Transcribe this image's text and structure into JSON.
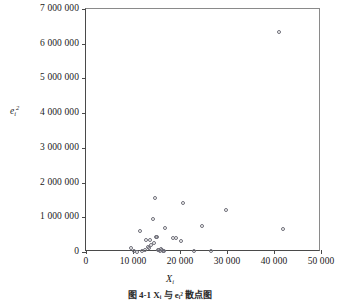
{
  "figure": {
    "caption": "图 4-1  Xᵢ 与 eᵢ² 散点图",
    "background_color": "#ffffff",
    "axis_color": "#4a4a4a",
    "marker_color": "#6e6e78"
  },
  "axis_titles": {
    "x": {
      "symbol": "X",
      "subscript": "i"
    },
    "y": {
      "symbol": "e",
      "subscript": "i",
      "superscript": "2"
    }
  },
  "chart_data": {
    "type": "scatter",
    "title": "",
    "subtitle": "",
    "xlabel": "X_i",
    "ylabel": "e_i^2",
    "xlim": [
      0,
      50000
    ],
    "ylim": [
      0,
      7000000
    ],
    "grid": false,
    "legend": "none",
    "marker": "open-circle",
    "xticks": [
      0,
      10000,
      20000,
      30000,
      40000,
      50000
    ],
    "xticklabels": [
      "0",
      "10 000",
      "20 000",
      "30 000",
      "40 000",
      "50 000"
    ],
    "yticks": [
      0,
      1000000,
      2000000,
      3000000,
      4000000,
      5000000,
      6000000,
      7000000
    ],
    "yticklabels": [
      "0",
      "1 000 000",
      "2 000 000",
      "3 000 000",
      "4 000 000",
      "5 000 000",
      "6 000 000",
      "7 000 000"
    ],
    "points": [
      {
        "x": 9600,
        "y": 120000
      },
      {
        "x": 10200,
        "y": 20000
      },
      {
        "x": 10900,
        "y": 10000
      },
      {
        "x": 11400,
        "y": 600000
      },
      {
        "x": 12000,
        "y": 30000
      },
      {
        "x": 12600,
        "y": 60000
      },
      {
        "x": 12800,
        "y": 340000
      },
      {
        "x": 13200,
        "y": 150000
      },
      {
        "x": 13400,
        "y": 120000
      },
      {
        "x": 13600,
        "y": 360000
      },
      {
        "x": 13900,
        "y": 200000
      },
      {
        "x": 14200,
        "y": 940000
      },
      {
        "x": 14400,
        "y": 260000
      },
      {
        "x": 14700,
        "y": 1560000
      },
      {
        "x": 14900,
        "y": 430000
      },
      {
        "x": 15100,
        "y": 420000
      },
      {
        "x": 15300,
        "y": 70000
      },
      {
        "x": 15500,
        "y": 50000
      },
      {
        "x": 15700,
        "y": 30000
      },
      {
        "x": 15900,
        "y": 90000
      },
      {
        "x": 16100,
        "y": 60000
      },
      {
        "x": 16300,
        "y": 40000
      },
      {
        "x": 16500,
        "y": 20000
      },
      {
        "x": 16800,
        "y": 700000
      },
      {
        "x": 18600,
        "y": 410000
      },
      {
        "x": 19100,
        "y": 400000
      },
      {
        "x": 20200,
        "y": 320000
      },
      {
        "x": 20700,
        "y": 1400000
      },
      {
        "x": 23000,
        "y": 20000
      },
      {
        "x": 24600,
        "y": 740000
      },
      {
        "x": 26700,
        "y": 40000
      },
      {
        "x": 29700,
        "y": 1210000
      },
      {
        "x": 41100,
        "y": 6350000
      },
      {
        "x": 42000,
        "y": 670000
      }
    ]
  }
}
